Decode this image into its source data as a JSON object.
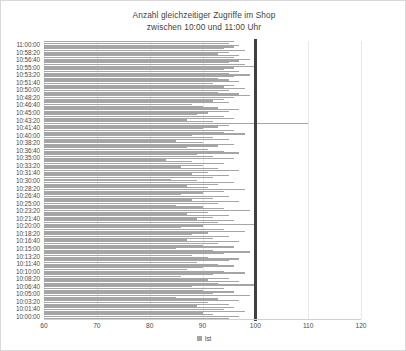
{
  "chart_data": {
    "type": "bar",
    "orientation": "horizontal",
    "title": "Anzahl gleichzeitiger Zugriffe im Shop",
    "subtitle": "zwischen 10:00 und 11:00 Uhr",
    "title_lines": [
      "Anzahl gleichzeitiger Zugriffe im Shop",
      "zwischen 10:00 und 11:00 Uhr"
    ],
    "xlabel": "",
    "ylabel": "",
    "xlim": [
      60,
      120
    ],
    "x_ticks": [
      60,
      70,
      80,
      90,
      100,
      110,
      120
    ],
    "y_ticks": [
      "11:00:00",
      "10:58:20",
      "10:56:40",
      "10:55:00",
      "10:53:20",
      "10:51:40",
      "10:50:00",
      "10:48:20",
      "10:46:40",
      "10:45:00",
      "10:43:20",
      "10:41:40",
      "10:40:00",
      "10:38:20",
      "10:36:40",
      "10:35:00",
      "10:33:20",
      "10:31:40",
      "10:30:00",
      "10:28:20",
      "10:26:40",
      "10:25:00",
      "10:23:20",
      "10:21:40",
      "10:20:00",
      "10:18:20",
      "10:16:40",
      "10:15:00",
      "10:13:20",
      "10:11:40",
      "10:10:00",
      "10:08:20",
      "10:06:40",
      "10:05:00",
      "10:03:20",
      "10:01:40",
      "10:00:00"
    ],
    "grid": true,
    "grid_axis": "x",
    "legend": [
      {
        "name": "Ist",
        "color": "#a5a5a5"
      }
    ],
    "legend_position": "bottom",
    "bar_color": "#a5a5a5",
    "threshold": {
      "value": 100,
      "color": "#404040",
      "label": ""
    },
    "series": [
      {
        "name": "Ist",
        "values": [
          96,
          95,
          97,
          96,
          94,
          98,
          95,
          93,
          97,
          96,
          99,
          97,
          95,
          98,
          100,
          96,
          94,
          97,
          95,
          99,
          96,
          93,
          95,
          97,
          92,
          96,
          94,
          98,
          95,
          93,
          97,
          99,
          96,
          94,
          92,
          95,
          88,
          90,
          93,
          97,
          95,
          91,
          89,
          94,
          96,
          87,
          92,
          110,
          95,
          93,
          90,
          96,
          94,
          98,
          88,
          92,
          95,
          85,
          90,
          96,
          93,
          87,
          91,
          94,
          97,
          89,
          92,
          96,
          83,
          88,
          94,
          90,
          86,
          93,
          97,
          91,
          88,
          95,
          92,
          84,
          89,
          96,
          93,
          87,
          91,
          98,
          94,
          90,
          86,
          95,
          92,
          88,
          97,
          93,
          85,
          90,
          94,
          99,
          91,
          87,
          95,
          92,
          89,
          96,
          93,
          100,
          90,
          86,
          94,
          98,
          91,
          88,
          95,
          92,
          87,
          97,
          93,
          90,
          96,
          85,
          92,
          99,
          94,
          88,
          91,
          97,
          95,
          89,
          93,
          96,
          90,
          87,
          94,
          98,
          92,
          86,
          95,
          91,
          97,
          93,
          100,
          88,
          94,
          90,
          96,
          92,
          99,
          85,
          93,
          97,
          91,
          95,
          89,
          96,
          94,
          98,
          90,
          92,
          97,
          95
        ]
      }
    ]
  }
}
